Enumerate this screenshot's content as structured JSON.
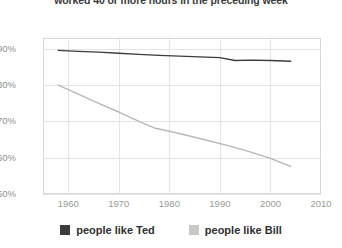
{
  "chart_data": {
    "type": "line",
    "title": "worked 40 or more hours in the preceding week",
    "xlabel": "",
    "ylabel": "",
    "xlim": [
      1955,
      2010
    ],
    "ylim": [
      50,
      93
    ],
    "grid": true,
    "legend_position": "bottom",
    "xticks": [
      "1960",
      "1970",
      "1980",
      "1990",
      "2000",
      "2010"
    ],
    "xtick_values": [
      1960,
      1970,
      1980,
      1990,
      2000,
      2010
    ],
    "yticks": [
      "50%",
      "60%",
      "70%",
      "80%",
      "90%"
    ],
    "ytick_values": [
      50,
      60,
      70,
      80,
      90
    ],
    "series": [
      {
        "name": "people like Ted",
        "color": "#3c3c3c",
        "x": [
          1958,
          1962,
          1966,
          1970,
          1974,
          1978,
          1982,
          1986,
          1990,
          1993,
          1996,
          2000,
          2004
        ],
        "values": [
          89.6,
          89.3,
          89.1,
          88.8,
          88.5,
          88.2,
          88.0,
          87.8,
          87.6,
          86.8,
          86.9,
          86.8,
          86.6
        ]
      },
      {
        "name": "people like Bill",
        "color": "#b8b8b8",
        "x": [
          1958,
          1962,
          1966,
          1970,
          1974,
          1977,
          1980,
          1984,
          1988,
          1992,
          1996,
          2000,
          2004
        ],
        "values": [
          80.0,
          77.5,
          75.0,
          72.6,
          70.0,
          68.2,
          67.3,
          66.0,
          64.6,
          63.2,
          61.6,
          59.8,
          57.6
        ]
      }
    ]
  },
  "legend": {
    "items": [
      {
        "label": "people like Ted",
        "color": "#3c3c3c",
        "swatch_name": "legend-swatch-dark"
      },
      {
        "label": "people like Bill",
        "color": "#c8c8c8",
        "swatch_name": "legend-swatch-light"
      }
    ]
  }
}
